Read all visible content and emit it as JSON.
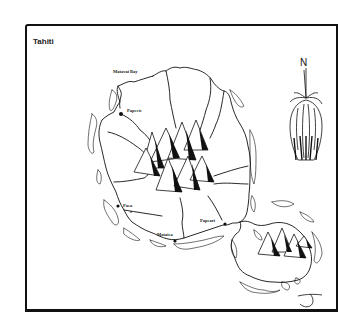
{
  "map": {
    "title": "Tahiti",
    "labels": {
      "matavai_bay": "Matavai Bay",
      "papeete": "Papeete",
      "paea": "Paea",
      "mataiea": "Mataiea",
      "papeari": "Papeari"
    },
    "compass": {
      "north_label": "N"
    },
    "signature": "J",
    "colors": {
      "ink": "#111111",
      "paper": "#ffffff"
    }
  }
}
